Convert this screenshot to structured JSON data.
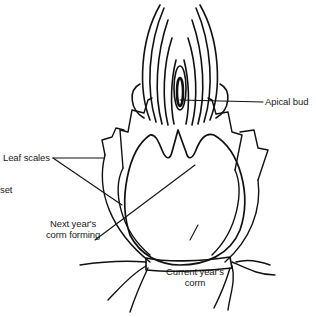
{
  "diagram": {
    "labels": {
      "apical_bud": "Apical bud",
      "leaf_scales": "Leaf scales",
      "cormlet_partial": "set",
      "next_year_line1": "Next year's",
      "next_year_line2": "corm forming",
      "current_year_line1": "Current year's",
      "current_year_line2": "corm"
    },
    "colors": {
      "line": "#111111",
      "text": "#1a1a1a",
      "background": "#ffffff"
    }
  }
}
